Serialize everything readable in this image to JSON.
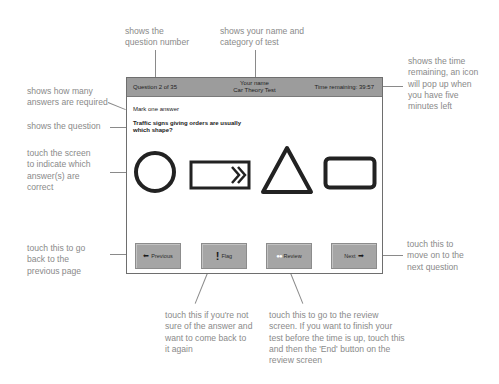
{
  "annotations": {
    "question_number": "shows the\nquestion number",
    "name_category": "shows your name and\ncategory of test",
    "time_remaining": "shows the time\nremaining, an icon\nwill pop up when\nyou have five\nminutes left",
    "answers_required": "shows how many\nanswers are required",
    "the_question": "shows the question",
    "touch_screen": "touch the screen\nto indicate which\nanswer(s) are\ncorrect",
    "previous": "touch this to go\nback to the\nprevious page",
    "next": "touch this to\nmove on to the\nnext question",
    "flag": "touch this if you're not\nsure of the answer and\nwant to come back to\nit again",
    "review": "touch this to go to the review\nscreen. If you want to finish your\ntest before the time is up, touch this\nand then the 'End' button on the\nreview screen"
  },
  "screen": {
    "header": {
      "question": "Question 2 of 35",
      "name": "Your name",
      "category": "Car Theory Test",
      "time": "Time remaining: 39:57"
    },
    "instruction": "Mark one answer",
    "question_text": "Traffic signs giving orders are usually which shape?",
    "answers": [
      {
        "shape": "circle"
      },
      {
        "shape": "arrow-rectangle"
      },
      {
        "shape": "triangle"
      },
      {
        "shape": "rectangle"
      }
    ],
    "buttons": {
      "previous": {
        "label": "Previous",
        "icon": "⬅"
      },
      "flag": {
        "label": "Flag",
        "icon": "!"
      },
      "review": {
        "label": "Review",
        "icon": "●●"
      },
      "next": {
        "label": "Next",
        "icon": "➡"
      }
    }
  }
}
